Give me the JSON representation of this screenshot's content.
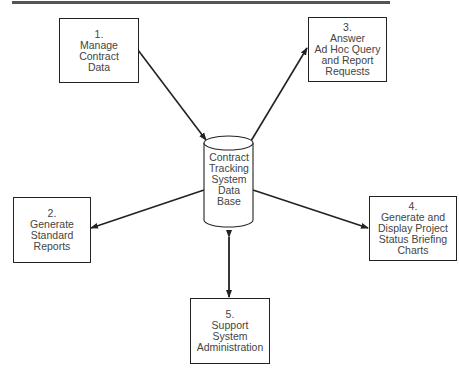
{
  "diagram": {
    "database": {
      "lines": [
        "Contract",
        "Tracking",
        "System",
        "Data",
        "Base"
      ]
    },
    "processes": [
      {
        "id": 1,
        "number": "1.",
        "lines": [
          "Manage",
          "Contract",
          "Data"
        ],
        "flow": "to-database"
      },
      {
        "id": 2,
        "number": "2.",
        "lines": [
          "Generate",
          "Standard",
          "Reports"
        ],
        "flow": "from-database"
      },
      {
        "id": 3,
        "number": "3.",
        "lines": [
          "Answer",
          "Ad Hoc Query",
          "and Report",
          "Requests"
        ],
        "flow": "from-database"
      },
      {
        "id": 4,
        "number": "4.",
        "lines": [
          "Generate and",
          "Display Project",
          "Status Briefing",
          "Charts"
        ],
        "flow": "from-database"
      },
      {
        "id": 5,
        "number": "5.",
        "lines": [
          "Support",
          "System",
          "Administration"
        ],
        "flow": "bidirectional"
      }
    ],
    "colors": {
      "line": "#222222",
      "text": "#444444",
      "background": "#ffffff"
    }
  }
}
